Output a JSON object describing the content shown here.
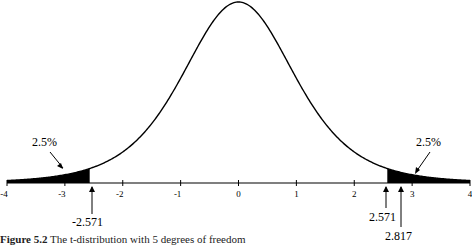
{
  "chart_data": {
    "type": "area",
    "title": "",
    "distribution": "t",
    "degrees_of_freedom": 5,
    "xlabel": "",
    "ylabel": "",
    "xlim": [
      -4,
      4
    ],
    "x_ticks": [
      -4,
      -3,
      -2,
      -1,
      0,
      1,
      2,
      3,
      4
    ],
    "x_tick_labels": [
      "-4",
      "-3",
      "-2",
      "-1",
      "0",
      "1",
      "2",
      "3",
      "4"
    ],
    "grid": false,
    "legend": null,
    "shaded_regions": [
      {
        "from": -4,
        "to": -2.571,
        "label": "2.5%"
      },
      {
        "from": 2.571,
        "to": 4,
        "label": "2.5%"
      }
    ],
    "annotations": [
      {
        "text": "2.5%",
        "target": "left-tail"
      },
      {
        "text": "2.5%",
        "target": "right-tail"
      },
      {
        "text": "-2.571",
        "x": -2.571,
        "type": "arrow-up"
      },
      {
        "text": "2.571",
        "x": 2.571,
        "type": "arrow-up"
      },
      {
        "text": "2.817",
        "x": 2.817,
        "type": "arrow-up"
      }
    ]
  },
  "labels": {
    "tail_left_pct": "2.5%",
    "tail_right_pct": "2.5%",
    "crit_left": "-2.571",
    "crit_right": "2.571",
    "observed": "2.817"
  },
  "caption": {
    "figure_number": "Figure 5.2",
    "text": "The t-distribution with 5 degrees of freedom"
  }
}
